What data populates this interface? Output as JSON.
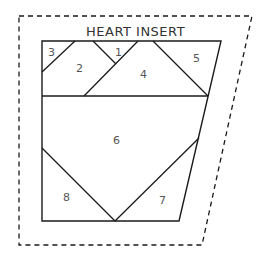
{
  "diagram": {
    "title": "HEART INSERT",
    "pieces": [
      {
        "id": "1",
        "label": "1",
        "x": 115,
        "y": 56
      },
      {
        "id": "2",
        "label": "2",
        "x": 79,
        "y": 71
      },
      {
        "id": "3",
        "label": "3",
        "x": 51,
        "y": 56
      },
      {
        "id": "4",
        "label": "4",
        "x": 143,
        "y": 77
      },
      {
        "id": "5",
        "label": "5",
        "x": 196,
        "y": 62
      },
      {
        "id": "6",
        "label": "6",
        "x": 116,
        "y": 144
      },
      {
        "id": "7",
        "label": "7",
        "x": 162,
        "y": 203
      },
      {
        "id": "8",
        "label": "8",
        "x": 66,
        "y": 200
      }
    ],
    "line_color": "#1a1a1a",
    "label_color": "#555555"
  }
}
